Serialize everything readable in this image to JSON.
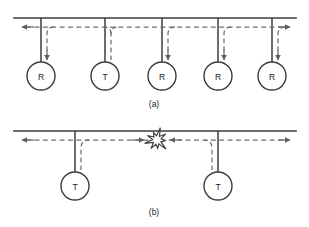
{
  "figure": {
    "background_color": "#ffffff",
    "solid_line_color": "#3c3c3c",
    "dashed_line_color": "#6e6e6e",
    "label_color": "#1a1a1a",
    "width": 309,
    "height": 227
  },
  "panels": [
    {
      "id": "panel-a",
      "caption": "(a)",
      "caption_x": 154,
      "caption_y": 104,
      "bus": {
        "x1": 14,
        "x2": 296,
        "y": 18,
        "name": "shared-bus-cable"
      },
      "signal": {
        "dashed_y": 27,
        "left_arrow_x": 22,
        "right_arrow_x": 290,
        "source_station_index": 1,
        "description": "Transmitted frame propagates in both directions and is copied by every receiving station"
      },
      "stations": [
        {
          "label": "R",
          "x": 41,
          "role": "receiver",
          "name": "station-a-1",
          "receives": true
        },
        {
          "label": "T",
          "x": 105,
          "role": "transmitter",
          "name": "station-a-2",
          "receives": false
        },
        {
          "label": "R",
          "x": 162,
          "role": "receiver",
          "name": "station-a-3",
          "receives": true
        },
        {
          "label": "R",
          "x": 218,
          "role": "receiver",
          "name": "station-a-4",
          "receives": true
        },
        {
          "label": "R",
          "x": 272,
          "role": "receiver",
          "name": "station-a-5",
          "receives": true
        }
      ],
      "circle_cy": 76,
      "circle_r": 14
    },
    {
      "id": "panel-b",
      "caption": "(b)",
      "caption_x": 154,
      "caption_y": 212,
      "bus": {
        "x1": 14,
        "x2": 296,
        "y": 131,
        "name": "shared-bus-cable"
      },
      "signal": {
        "dashed_y": 140,
        "left_arrow_x": 22,
        "right_arrow_x": 290,
        "description": "Two stations transmit simultaneously; their signals meet and collide on the bus"
      },
      "collision": {
        "x": 157,
        "y": 140,
        "name": "collision-burst",
        "label": "collision"
      },
      "stations": [
        {
          "label": "T",
          "x": 75,
          "role": "transmitter",
          "name": "station-b-1"
        },
        {
          "label": "T",
          "x": 218,
          "role": "transmitter",
          "name": "station-b-2"
        }
      ],
      "circle_cy": 186,
      "circle_r": 14
    }
  ]
}
